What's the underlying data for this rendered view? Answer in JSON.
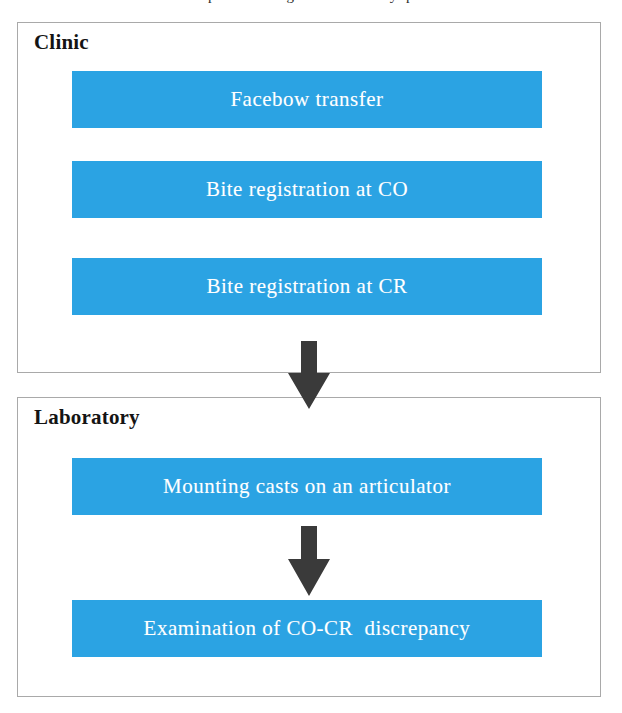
{
  "page": {
    "background_color": "#ffffff",
    "width": 622,
    "height": 713,
    "cropped_caption_fragment": "scanned page text partially cut off above the figure"
  },
  "style": {
    "process_box_color": "#2BA3E3",
    "process_text_color": "#ffffff",
    "section_border_color": "#a9a9a9",
    "section_title_color": "#141414",
    "arrow_color": "#3a3a3a"
  },
  "diagram": {
    "type": "flowchart",
    "orientation": "top-to-bottom",
    "sections": [
      {
        "id": "clinic",
        "title": "Clinic",
        "steps": [
          {
            "id": "facebow",
            "label": "Facebow transfer"
          },
          {
            "id": "bite-co",
            "label": "Bite registration at CO"
          },
          {
            "id": "bite-cr",
            "label": "Bite registration at CR"
          }
        ]
      },
      {
        "id": "laboratory",
        "title": "Laboratory",
        "steps": [
          {
            "id": "mounting",
            "label": "Mounting casts on an articulator"
          },
          {
            "id": "examination",
            "label": "Examination of CO-CR  discrepancy"
          }
        ]
      }
    ],
    "connectors": [
      {
        "id": "clinic-to-laboratory",
        "icon": "down-arrow-icon",
        "from": "clinic",
        "to": "laboratory"
      },
      {
        "id": "mounting-to-examination",
        "icon": "down-arrow-icon",
        "from": "mounting",
        "to": "examination"
      }
    ]
  }
}
